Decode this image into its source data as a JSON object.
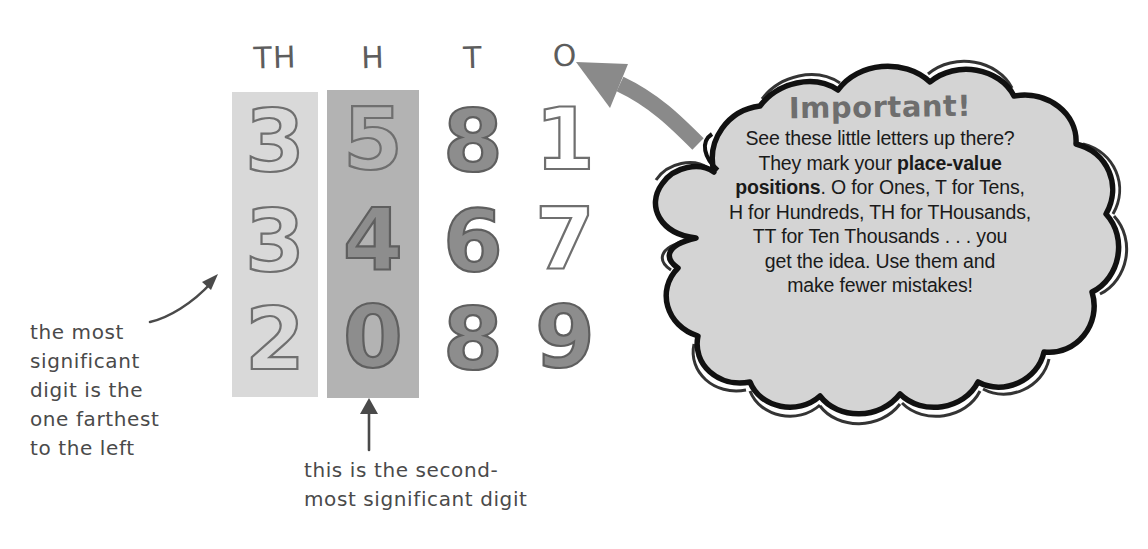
{
  "figure": {
    "kind": "place-value-diagram",
    "colors": {
      "highlight_light": "#d9d9d9",
      "highlight_dark": "#b3b3b3",
      "digit_stroke": "#6f6f6f",
      "bubble_fill": "#d4d4d4",
      "bubble_outline": "#111111",
      "arrow_gray": "#8a8a8a",
      "hand_text": "#4a4a4a",
      "title_gray": "#6e6e6e"
    }
  },
  "table": {
    "headers": [
      "TH",
      "H",
      "T",
      "O"
    ],
    "rows": [
      [
        "3",
        "5",
        "8",
        "1"
      ],
      [
        "3",
        "4",
        "6",
        "7"
      ],
      [
        "2",
        "0",
        "8",
        "9"
      ]
    ],
    "highlighted_columns": [
      {
        "header": "TH",
        "shade": "light"
      },
      {
        "header": "H",
        "shade": "dark"
      }
    ]
  },
  "annotations": {
    "left": "the most\nsignificant\ndigit is the\none farthest\nto the left",
    "bottom": "this is the second-\nmost significant digit"
  },
  "callout": {
    "title": "Important!",
    "body_lines": [
      "See these little letters up there?",
      "They mark your <b>place-value</b>",
      "<b>positions</b>. O for Ones, T for Tens,",
      "H for Hundreds, TH for THousands,",
      "TT for Ten Thousands . . . you",
      "get the idea. Use them and",
      "make fewer mistakes!"
    ],
    "body_plain": "See these little letters up there? They mark your place-value positions. O for Ones, T for Tens, H for Hundreds, TH for THousands, TT for Ten Thousands . . . you get the idea. Use them and make fewer mistakes!"
  },
  "arrows": [
    {
      "name": "callout-to-ones-header",
      "style": "thick-curved-gray",
      "direction": "points-left-up"
    },
    {
      "name": "left-note-to-thousands-column",
      "style": "thin-curved",
      "direction": "points-up-right"
    },
    {
      "name": "bottom-note-to-hundreds-column",
      "style": "thin-straight",
      "direction": "points-up"
    }
  ]
}
